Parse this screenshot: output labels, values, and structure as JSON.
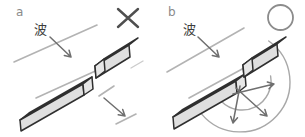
{
  "panels": [
    {
      "label": "a",
      "wave_label": "波",
      "mark": "incorrect",
      "mark_icon": "x-mark-icon",
      "mark_symbol": "×"
    },
    {
      "label": "b",
      "wave_label": "波",
      "mark": "correct",
      "mark_icon": "circle-mark-icon",
      "mark_symbol": "○"
    }
  ],
  "colors": {
    "background": "#ffffff",
    "wave_line": "#b3b3b3",
    "faint_line": "#cccccc",
    "bar_outline": "#2f2f2f",
    "bar_top": "#ededed",
    "bar_front": "#dfdfdf",
    "bar_end": "#e7e7e7",
    "arrow": "#6f6f6f",
    "arc": "#a8a8a8",
    "x_mark": "#4f4f4f",
    "circle_mark": "#8c8c8c",
    "panel_label": "#8a8a8a",
    "wave_text": "#3c3c3c"
  }
}
